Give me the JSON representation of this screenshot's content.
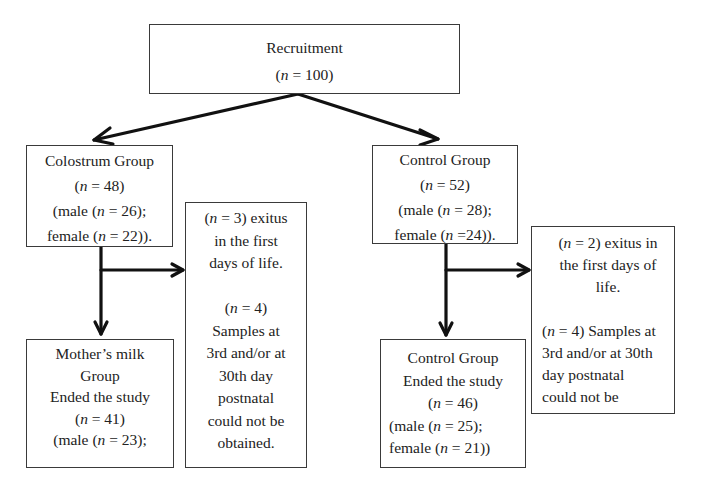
{
  "diagram": {
    "type": "flowchart",
    "nodes": {
      "recruitment": {
        "title": "Recruitment",
        "n_label": "(n = 100)",
        "n": 100
      },
      "colostrum_group": {
        "title": "Colostrum Group",
        "n_label": "(n = 48)",
        "male_label": "(male (n = 26);",
        "female_label": "female (n = 22)).",
        "n": 48,
        "male": 26,
        "female": 22
      },
      "control_group": {
        "title": "Control Group",
        "n_label": "(n = 52)",
        "male_label": "(male (n = 28);",
        "female_label": "female (n =24)).",
        "n": 52,
        "male": 28,
        "female": 24
      },
      "colostrum_exclusions": {
        "lines": [
          "(n = 3) exitus",
          "in the first",
          "days of life.",
          "",
          "(n = 4)",
          "Samples at",
          "3rd and/or at",
          "30th day",
          "postnatal",
          "could not be",
          "obtained."
        ],
        "exitus_n": 3,
        "samples_missing_n": 4
      },
      "control_exclusions": {
        "lines": [
          "(n = 2) exitus in",
          "the first days of",
          "life.",
          "",
          "(n = 4) Samples at",
          "3rd and/or at 30th",
          "day postnatal",
          "could not be"
        ],
        "exitus_n": 2,
        "samples_missing_n": 4
      },
      "mothers_milk_ended": {
        "line1": "Mother’s milk",
        "line2": "Group",
        "line3": "Ended the study",
        "n_label": "(n = 41)",
        "male_label": "(male (n = 23);",
        "n": 41,
        "male": 23
      },
      "control_ended": {
        "line1": "Control Group",
        "line2": "Ended the study",
        "n_label": "(n = 46)",
        "male_label": "(male (n = 25);",
        "female_label": "female (n = 21))",
        "n": 46,
        "male": 25,
        "female": 21
      }
    },
    "edges": [
      {
        "from": "recruitment",
        "to": "colostrum_group"
      },
      {
        "from": "recruitment",
        "to": "control_group"
      },
      {
        "from": "colostrum_group",
        "to": "colostrum_exclusions"
      },
      {
        "from": "colostrum_group",
        "to": "mothers_milk_ended"
      },
      {
        "from": "control_group",
        "to": "control_exclusions"
      },
      {
        "from": "control_group",
        "to": "control_ended"
      }
    ],
    "colors": {
      "box_border": "#3a3a3a",
      "arrow": "#111111",
      "text": "#222222",
      "background": "#ffffff"
    }
  }
}
